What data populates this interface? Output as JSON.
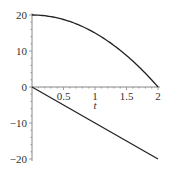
{
  "chart_data": {
    "type": "line",
    "title": "",
    "xlabel": "t",
    "ylabel": "",
    "xlim": [
      0,
      2
    ],
    "ylim": [
      -20,
      20
    ],
    "x_ticks": [
      0.5,
      1,
      1.5,
      2
    ],
    "x_tick_labels": [
      "0.5",
      "1",
      "1.5",
      "2"
    ],
    "y_ticks": [
      -20,
      -10,
      0,
      10,
      20
    ],
    "y_tick_labels": [
      "-20",
      "-10",
      "0",
      "10",
      "20"
    ],
    "grid": false,
    "legend": null,
    "series": [
      {
        "name": "curve-upper",
        "expression": "20 - 5t^2",
        "x": [
          0,
          0.25,
          0.5,
          0.75,
          1,
          1.25,
          1.5,
          1.75,
          2
        ],
        "values": [
          20,
          19.69,
          18.75,
          17.19,
          15,
          12.19,
          8.75,
          4.69,
          0
        ]
      },
      {
        "name": "line-lower",
        "expression": "-10t",
        "x": [
          0,
          0.5,
          1,
          1.5,
          2
        ],
        "values": [
          0,
          -5,
          -10,
          -15,
          -20
        ]
      }
    ],
    "colors": {
      "line": "#222222",
      "axis": "#888888"
    }
  }
}
